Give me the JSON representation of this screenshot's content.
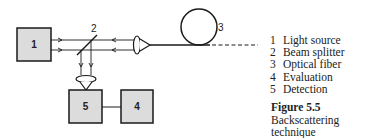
{
  "diagram": {
    "components": [
      {
        "id": "1",
        "label": "1"
      },
      {
        "id": "2",
        "label": "2"
      },
      {
        "id": "3",
        "label": "3"
      },
      {
        "id": "4",
        "label": "4"
      },
      {
        "id": "5",
        "label": "5"
      }
    ],
    "colors": {
      "stroke": "#1a1a1a",
      "box_fill": "#dcdcdc"
    }
  },
  "legend": {
    "items": [
      {
        "num": "1",
        "text": "Light source"
      },
      {
        "num": "2",
        "text": "Beam splitter"
      },
      {
        "num": "3",
        "text": "Optical fiber"
      },
      {
        "num": "4",
        "text": "Evaluation"
      },
      {
        "num": "5",
        "text": "Detection"
      }
    ]
  },
  "caption": {
    "figure": "Figure 5.5",
    "title": "Backscattering technique"
  }
}
